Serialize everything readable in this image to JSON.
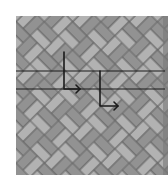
{
  "diagram": {
    "type": "herringbone-pattern-with-arrows",
    "background": "#ffffff",
    "pattern": {
      "x": 16,
      "y": 16,
      "width": 152,
      "height": 159,
      "brick_light": "#b2b2b2",
      "brick_dark": "#929292",
      "mortar": "#666666",
      "edge_strip": "#7a7a7a"
    },
    "lines": [
      {
        "name": "horizontal-line-top",
        "y": 71,
        "x1": 16,
        "x2": 165
      },
      {
        "name": "horizontal-line-bottom",
        "y": 89,
        "x1": 16,
        "x2": 165
      }
    ],
    "arrows": [
      {
        "name": "arrow-1",
        "x": 64,
        "y_top": 52,
        "y_bottom": 89,
        "x_end": 80
      },
      {
        "name": "arrow-2",
        "x": 100,
        "y_top": 71,
        "y_bottom": 106,
        "x_end": 118
      }
    ],
    "line_color": "#1a1a1a"
  }
}
